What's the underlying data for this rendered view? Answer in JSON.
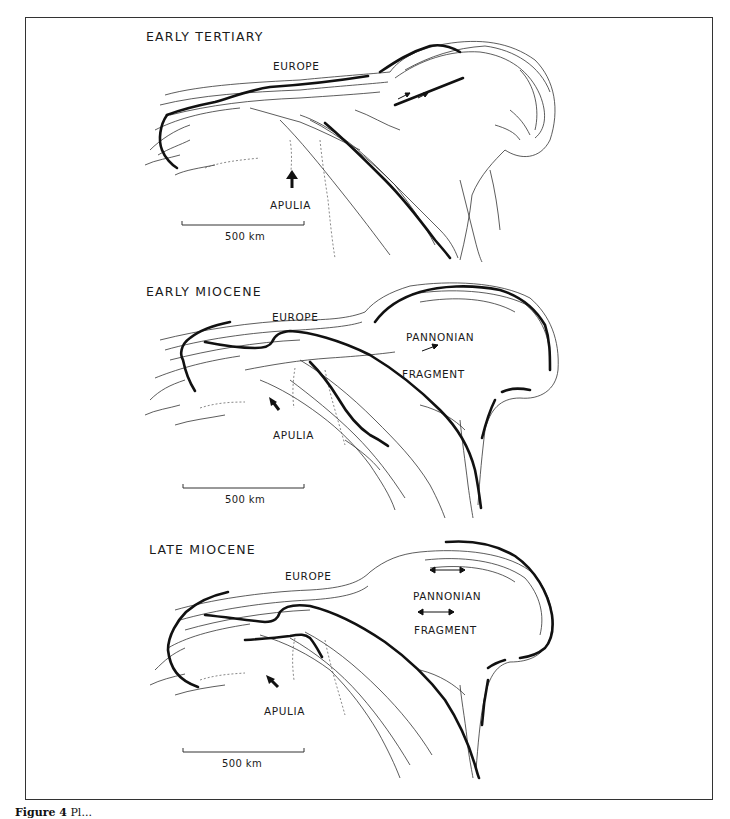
{
  "figure": {
    "caption_prefix": "Figure 4",
    "caption_text": "Pl..."
  },
  "panels": [
    {
      "title": "EARLY TERTIARY",
      "labels": {
        "europe": "EUROPE",
        "apulia": "APULIA"
      },
      "scale_bar": "500 km",
      "apulia_motion": "north"
    },
    {
      "title": "EARLY MIOCENE",
      "labels": {
        "europe": "EUROPE",
        "apulia": "APULIA",
        "pannonian": "PANNONIAN",
        "fragment": "FRAGMENT"
      },
      "scale_bar": "500 km",
      "apulia_motion": "north-west",
      "pannonian_motion": "north-east"
    },
    {
      "title": "LATE MIOCENE",
      "labels": {
        "europe": "EUROPE",
        "apulia": "APULIA",
        "pannonian": "PANNONIAN",
        "fragment": "FRAGMENT"
      },
      "scale_bar": "500 km",
      "apulia_motion": "north-west",
      "pannonian_motion": "east-west extension"
    }
  ],
  "colors": {
    "ink": "#1a1a1a",
    "frame": "#333333",
    "background": "#ffffff"
  }
}
